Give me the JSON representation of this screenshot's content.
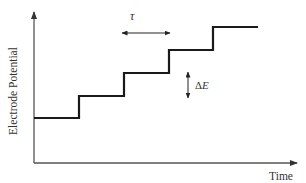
{
  "diagram": {
    "type": "staircase-potential-waveform",
    "axes": {
      "y_label": "Electrode Potential",
      "x_label": "Time"
    },
    "annotations": {
      "step_duration_label": "τ",
      "step_height_label_prefix": "Δ",
      "step_height_label_var": "E"
    },
    "steps": 5,
    "colors": {
      "axis": "#555555",
      "waveform": "#1a1a1a",
      "annotation": "#333333"
    }
  }
}
